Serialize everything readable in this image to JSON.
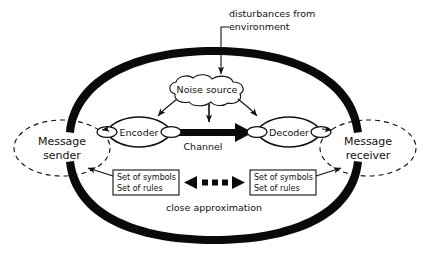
{
  "diagram": {
    "colors": {
      "ink": "#111111",
      "fat_arc": "#0a0a0a",
      "background": "#ffffff"
    },
    "annotations": {
      "disturbances_line1": "disturbances from",
      "disturbances_line2": "environment",
      "close_approximation": "close approximation"
    },
    "nodes": {
      "noise_source": "Noise source",
      "encoder": "Encoder",
      "decoder": "Decoder",
      "channel": "Channel",
      "message_sender_line1": "Message",
      "message_sender_line2": "sender",
      "message_receiver_line1": "Message",
      "message_receiver_line2": "receiver"
    },
    "boxes": {
      "left": {
        "line1": "Set of symbols",
        "line2": "Set of rules"
      },
      "right": {
        "line1": "Set of symbols",
        "line2": "Set of rules"
      }
    }
  }
}
